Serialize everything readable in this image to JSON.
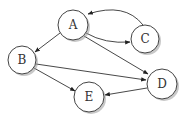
{
  "diagram": {
    "type": "directed-graph",
    "nodes": [
      {
        "id": "A",
        "label": "A",
        "x": 73,
        "y": 25,
        "r": 15
      },
      {
        "id": "B",
        "label": "B",
        "x": 22,
        "y": 60,
        "r": 14
      },
      {
        "id": "C",
        "label": "C",
        "x": 145,
        "y": 39,
        "r": 14
      },
      {
        "id": "D",
        "label": "D",
        "x": 162,
        "y": 84,
        "r": 15
      },
      {
        "id": "E",
        "label": "E",
        "x": 89,
        "y": 97,
        "r": 15
      }
    ],
    "edges": [
      {
        "from": "A",
        "to": "B",
        "curved": false
      },
      {
        "from": "A",
        "to": "C",
        "curved": true
      },
      {
        "from": "C",
        "to": "A",
        "curved": true
      },
      {
        "from": "A",
        "to": "D",
        "curved": false
      },
      {
        "from": "B",
        "to": "D",
        "curved": false
      },
      {
        "from": "B",
        "to": "E",
        "curved": false
      },
      {
        "from": "D",
        "to": "E",
        "curved": false
      }
    ],
    "colors": {
      "stroke": "#333333",
      "node_fill": "#ffffff",
      "shadow": "#9a9a9a",
      "background": "#ffffff"
    }
  }
}
